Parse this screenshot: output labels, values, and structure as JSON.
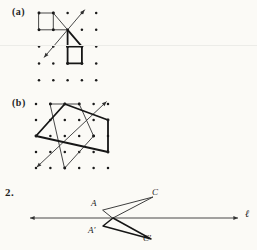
{
  "background": "#fbfaf6",
  "ink": {
    "thick": "#161616",
    "thin": "#3e3e3e",
    "dot": "#1b1b1b",
    "arrow": "#333333",
    "label": "#1c1c1c"
  },
  "panel_a": {
    "label": "(a)",
    "grid": {
      "cols": 5,
      "rows": 5,
      "x0": 39,
      "y0": 13,
      "dx": 14.3,
      "dy": 16.8,
      "dot_r": 1.25
    },
    "thick_closed_polygon": [
      [
        2,
        2
      ],
      [
        3,
        2
      ],
      [
        3,
        3
      ],
      [
        2,
        3
      ]
    ],
    "thick_segments": [
      [
        [
          2,
          1
        ],
        [
          2,
          2
        ]
      ],
      [
        [
          2,
          1
        ],
        [
          3,
          2
        ]
      ]
    ],
    "thin_closed_polygon": [
      [
        0,
        0
      ],
      [
        1,
        0
      ],
      [
        1,
        1
      ],
      [
        0,
        1
      ]
    ],
    "thin_segments": [
      [
        [
          1,
          1
        ],
        [
          2,
          1
        ]
      ],
      [
        [
          1,
          0
        ],
        [
          2,
          1
        ]
      ]
    ],
    "mirror_arrow": {
      "from": [
        0.35,
        2.65
      ],
      "to": [
        3.2,
        -0.2
      ]
    }
  },
  "panel_b": {
    "label": "(b)",
    "grid": {
      "cols": 6,
      "rows": 5,
      "x0": 36,
      "y0": 104,
      "dx": 14.4,
      "dy": 16,
      "dot_r": 1.25
    },
    "thick_closed_polygon": [
      [
        0,
        2
      ],
      [
        2,
        0
      ],
      [
        5,
        1
      ],
      [
        5,
        3
      ]
    ],
    "thick_segments": [],
    "thin_closed_polygon": [
      [
        1,
        0
      ],
      [
        3,
        0
      ],
      [
        4,
        2
      ],
      [
        2,
        4
      ]
    ],
    "thin_segments": [],
    "mirror_arrow": {
      "from": [
        0.05,
        3.95
      ],
      "to": [
        4.9,
        -0.15
      ]
    }
  },
  "item2": {
    "number": "2.",
    "line": {
      "x1": 30,
      "y1": 218,
      "x2": 238,
      "y2": 218
    },
    "upper_triangle": [
      [
        103,
        210
      ],
      [
        153,
        197
      ],
      [
        113,
        218
      ]
    ],
    "lower_triangle": [
      [
        103,
        226
      ],
      [
        113,
        218
      ],
      [
        151,
        239
      ]
    ],
    "labels": {
      "A": "A",
      "C": "C",
      "A_prime": "A′",
      "C_prime": "C′",
      "line_label": "ℓ"
    }
  }
}
